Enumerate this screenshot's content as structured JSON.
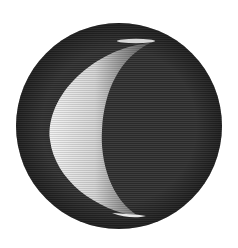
{
  "image": {
    "subject": "Engraving of a crescent moon (waxing/waning phase) within a dark hatched disc",
    "background": "#ffffff",
    "disc_color": "#2e2e2e",
    "crescent_light": "#e6e6e6",
    "crescent_mid": "#9a9a9a"
  }
}
